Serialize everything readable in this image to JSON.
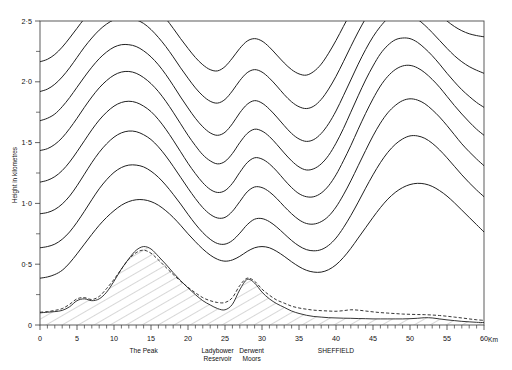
{
  "chart_data": {
    "type": "line",
    "title": "",
    "subtitle": "",
    "xlabel": "",
    "ylabel": "Height in kilometres",
    "xlim": [
      0,
      60
    ],
    "ylim": [
      0,
      2.5
    ],
    "grid": false,
    "legend": false,
    "x_unit_suffix": "Km",
    "x_ticks": [
      0,
      5,
      10,
      15,
      20,
      25,
      30,
      35,
      40,
      45,
      50,
      55,
      60
    ],
    "x_tick_labels": [
      "0",
      "5",
      "10",
      "15",
      "20",
      "25",
      "30",
      "35",
      "40",
      "45",
      "50",
      "55",
      "60"
    ],
    "x_minor_step": 1,
    "y_ticks": [
      0,
      0.5,
      1.0,
      1.5,
      2.0,
      2.5
    ],
    "y_tick_labels": [
      "0",
      "0·5",
      "1·0",
      "1·5",
      "2·0",
      "2·5"
    ],
    "y_minor_step": 0.25,
    "annotations": [
      {
        "text": "The Peak",
        "x": 14.0,
        "lines": [
          "The Peak"
        ]
      },
      {
        "text": "Ladybower Reservoir",
        "x": 24.0,
        "lines": [
          "Ladybower",
          "Reservoir"
        ]
      },
      {
        "text": "Derwent Moors",
        "x": 28.6,
        "lines": [
          "Derwent",
          "Moors"
        ]
      },
      {
        "text": "SHEFFIELD",
        "x": 40.0,
        "lines": [
          "SHEFFIELD"
        ]
      }
    ],
    "x": [
      0,
      1,
      2,
      3,
      4,
      5,
      6,
      7,
      8,
      9,
      10,
      11,
      12,
      13,
      14,
      15,
      16,
      17,
      18,
      19,
      20,
      21,
      22,
      23,
      24,
      25,
      26,
      27,
      28,
      29,
      30,
      31,
      32,
      33,
      34,
      35,
      36,
      37,
      38,
      39,
      40,
      41,
      42,
      43,
      44,
      45,
      46,
      47,
      48,
      49,
      50,
      51,
      52,
      53,
      54,
      55,
      56,
      57,
      58,
      59,
      60
    ],
    "series": [
      {
        "name": "terrain-profile",
        "style": "solid-hatched",
        "description": "Ground surface elevation profile (hatched below)",
        "values": [
          0.1,
          0.105,
          0.11,
          0.12,
          0.15,
          0.2,
          0.215,
          0.2,
          0.215,
          0.27,
          0.36,
          0.46,
          0.545,
          0.615,
          0.645,
          0.625,
          0.565,
          0.5,
          0.43,
          0.365,
          0.305,
          0.25,
          0.2,
          0.165,
          0.135,
          0.125,
          0.17,
          0.29,
          0.375,
          0.345,
          0.27,
          0.215,
          0.175,
          0.145,
          0.115,
          0.095,
          0.08,
          0.07,
          0.065,
          0.06,
          0.058,
          0.056,
          0.055,
          0.053,
          0.052,
          0.05,
          0.05,
          0.05,
          0.05,
          0.05,
          0.052,
          0.055,
          0.06,
          0.058,
          0.05,
          0.042,
          0.036,
          0.03,
          0.026,
          0.022,
          0.02
        ]
      },
      {
        "name": "airflow-lowest-dashed",
        "style": "dashed",
        "description": "Dashed trajectory hugging terrain / displaced streamline",
        "values": [
          0.105,
          0.11,
          0.12,
          0.135,
          0.17,
          0.215,
          0.225,
          0.21,
          0.235,
          0.3,
          0.375,
          0.46,
          0.54,
          0.595,
          0.615,
          0.59,
          0.535,
          0.475,
          0.415,
          0.36,
          0.31,
          0.265,
          0.225,
          0.2,
          0.185,
          0.185,
          0.225,
          0.325,
          0.385,
          0.36,
          0.295,
          0.245,
          0.205,
          0.18,
          0.155,
          0.14,
          0.13,
          0.122,
          0.118,
          0.115,
          0.113,
          0.118,
          0.125,
          0.122,
          0.115,
          0.108,
          0.102,
          0.098,
          0.094,
          0.09,
          0.088,
          0.086,
          0.085,
          0.082,
          0.078,
          0.072,
          0.065,
          0.058,
          0.05,
          0.043,
          0.038
        ]
      },
      {
        "name": "streamline-1",
        "style": "solid",
        "start_height": 0.385,
        "values": [
          0.385,
          0.395,
          0.415,
          0.45,
          0.51,
          0.585,
          0.665,
          0.745,
          0.82,
          0.885,
          0.94,
          0.985,
          1.015,
          1.03,
          1.03,
          1.015,
          0.985,
          0.94,
          0.885,
          0.82,
          0.75,
          0.685,
          0.625,
          0.575,
          0.54,
          0.525,
          0.535,
          0.565,
          0.605,
          0.635,
          0.645,
          0.635,
          0.605,
          0.565,
          0.52,
          0.48,
          0.45,
          0.435,
          0.435,
          0.455,
          0.495,
          0.555,
          0.63,
          0.715,
          0.8,
          0.885,
          0.965,
          1.035,
          1.09,
          1.13,
          1.155,
          1.165,
          1.16,
          1.14,
          1.105,
          1.06,
          1.005,
          0.945,
          0.885,
          0.825,
          0.765
        ]
      },
      {
        "name": "streamline-2",
        "style": "solid",
        "start_height": 0.635,
        "values": [
          0.635,
          0.645,
          0.665,
          0.705,
          0.765,
          0.845,
          0.935,
          1.03,
          1.12,
          1.195,
          1.255,
          1.295,
          1.315,
          1.315,
          1.3,
          1.265,
          1.215,
          1.15,
          1.075,
          0.995,
          0.91,
          0.83,
          0.76,
          0.705,
          0.67,
          0.665,
          0.695,
          0.755,
          0.825,
          0.87,
          0.875,
          0.85,
          0.805,
          0.75,
          0.695,
          0.65,
          0.62,
          0.61,
          0.62,
          0.655,
          0.715,
          0.8,
          0.9,
          1.01,
          1.125,
          1.235,
          1.335,
          1.42,
          1.485,
          1.53,
          1.555,
          1.555,
          1.535,
          1.495,
          1.44,
          1.375,
          1.305,
          1.235,
          1.17,
          1.11,
          1.055
        ]
      },
      {
        "name": "streamline-3",
        "style": "solid",
        "start_height": 0.915,
        "values": [
          0.915,
          0.925,
          0.95,
          0.995,
          1.06,
          1.145,
          1.24,
          1.335,
          1.42,
          1.49,
          1.545,
          1.58,
          1.595,
          1.59,
          1.565,
          1.525,
          1.465,
          1.39,
          1.305,
          1.215,
          1.125,
          1.04,
          0.965,
          0.91,
          0.88,
          0.885,
          0.935,
          1.015,
          1.095,
          1.135,
          1.13,
          1.095,
          1.04,
          0.975,
          0.915,
          0.865,
          0.835,
          0.83,
          0.85,
          0.895,
          0.97,
          1.07,
          1.185,
          1.31,
          1.435,
          1.555,
          1.66,
          1.745,
          1.805,
          1.845,
          1.86,
          1.85,
          1.82,
          1.77,
          1.71,
          1.64,
          1.565,
          1.49,
          1.425,
          1.365,
          1.31
        ]
      },
      {
        "name": "streamline-4",
        "style": "solid",
        "start_height": 1.175,
        "values": [
          1.175,
          1.19,
          1.22,
          1.27,
          1.34,
          1.425,
          1.515,
          1.605,
          1.685,
          1.75,
          1.8,
          1.83,
          1.84,
          1.83,
          1.8,
          1.755,
          1.69,
          1.61,
          1.52,
          1.425,
          1.33,
          1.245,
          1.17,
          1.115,
          1.09,
          1.105,
          1.165,
          1.255,
          1.335,
          1.375,
          1.365,
          1.325,
          1.265,
          1.195,
          1.13,
          1.08,
          1.055,
          1.055,
          1.085,
          1.145,
          1.235,
          1.35,
          1.475,
          1.61,
          1.74,
          1.86,
          1.965,
          2.045,
          2.1,
          2.13,
          2.135,
          2.115,
          2.075,
          2.02,
          1.955,
          1.88,
          1.805,
          1.735,
          1.67,
          1.61,
          1.56
        ]
      },
      {
        "name": "streamline-5",
        "style": "solid",
        "start_height": 1.435,
        "values": [
          1.435,
          1.45,
          1.485,
          1.54,
          1.615,
          1.7,
          1.79,
          1.875,
          1.95,
          2.01,
          2.055,
          2.08,
          2.085,
          2.07,
          2.035,
          1.985,
          1.92,
          1.84,
          1.75,
          1.655,
          1.56,
          1.475,
          1.4,
          1.35,
          1.325,
          1.345,
          1.41,
          1.5,
          1.575,
          1.61,
          1.595,
          1.55,
          1.485,
          1.415,
          1.35,
          1.3,
          1.275,
          1.285,
          1.325,
          1.395,
          1.495,
          1.615,
          1.75,
          1.885,
          2.015,
          2.13,
          2.23,
          2.3,
          2.345,
          2.36,
          2.355,
          2.325,
          2.275,
          2.215,
          2.145,
          2.07,
          2.0,
          1.935,
          1.88,
          1.83,
          1.79
        ]
      },
      {
        "name": "streamline-6",
        "style": "solid",
        "start_height": 1.68,
        "values": [
          1.68,
          1.7,
          1.735,
          1.795,
          1.87,
          1.955,
          2.04,
          2.12,
          2.19,
          2.245,
          2.285,
          2.305,
          2.305,
          2.29,
          2.255,
          2.205,
          2.14,
          2.06,
          1.97,
          1.875,
          1.785,
          1.7,
          1.63,
          1.58,
          1.56,
          1.585,
          1.655,
          1.745,
          1.815,
          1.845,
          1.825,
          1.775,
          1.71,
          1.64,
          1.575,
          1.53,
          1.51,
          1.525,
          1.575,
          1.655,
          1.76,
          1.885,
          2.015,
          2.145,
          2.265,
          2.37,
          2.455,
          2.52,
          2.555,
          2.565,
          2.55,
          2.515,
          2.465,
          2.405,
          2.34,
          2.275,
          2.215,
          2.165,
          2.125,
          2.095,
          2.07
        ]
      },
      {
        "name": "streamline-7",
        "style": "solid",
        "start_height": 1.92,
        "values": [
          1.92,
          1.94,
          1.98,
          2.04,
          2.115,
          2.2,
          2.285,
          2.36,
          2.425,
          2.475,
          2.51,
          2.525,
          2.525,
          2.51,
          2.48,
          2.43,
          2.365,
          2.29,
          2.205,
          2.115,
          2.03,
          1.95,
          1.885,
          1.84,
          1.825,
          1.855,
          1.925,
          2.01,
          2.075,
          2.1,
          2.08,
          2.03,
          1.965,
          1.895,
          1.835,
          1.795,
          1.78,
          1.8,
          1.855,
          1.94,
          2.045,
          2.165,
          2.29,
          2.41,
          2.52,
          2.615,
          2.69,
          2.745,
          2.77,
          2.77,
          2.75,
          2.71,
          2.66,
          2.605,
          2.55,
          2.5,
          2.455,
          2.42,
          2.395,
          2.38,
          2.37
        ]
      },
      {
        "name": "streamline-8",
        "style": "solid",
        "start_height": 2.165,
        "values": [
          2.165,
          2.185,
          2.225,
          2.285,
          2.36,
          2.44,
          2.52,
          2.59,
          2.65,
          2.695,
          2.725,
          2.74,
          2.74,
          2.725,
          2.695,
          2.65,
          2.59,
          2.52,
          2.44,
          2.355,
          2.275,
          2.2,
          2.14,
          2.1,
          2.09,
          2.125,
          2.195,
          2.275,
          2.335,
          2.355,
          2.335,
          2.285,
          2.22,
          2.155,
          2.1,
          2.065,
          2.055,
          2.085,
          2.145,
          2.235,
          2.34,
          2.455,
          2.57,
          2.68,
          2.775,
          2.855,
          2.915,
          2.955,
          2.97,
          2.965,
          2.94,
          2.9,
          2.855,
          2.81,
          2.77,
          2.735,
          2.71,
          2.695,
          2.685,
          2.685,
          2.69
        ]
      }
    ]
  },
  "axes": {
    "y_axis_title": "Height in kilometres",
    "x_unit": "Km"
  },
  "plot_geometry": {
    "left": 40,
    "right": 484,
    "top": 21,
    "bottom": 325
  }
}
